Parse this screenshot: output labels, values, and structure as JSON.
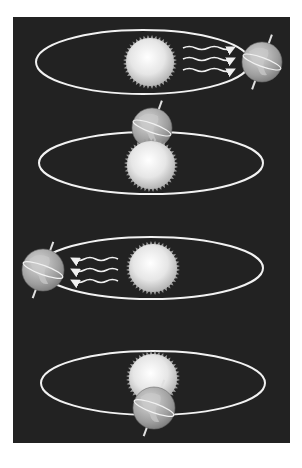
{
  "colors": {
    "page_background": "#ffffff",
    "panel_background": "#222222",
    "orbit_line": "#f2f2f2",
    "sun_center": "#ffffff",
    "sun_edge": "#bdbdbd",
    "earth_ocean": "#9a9a9a",
    "earth_land": "#c8c8c8",
    "wave_color": "#f0f0f0"
  },
  "panels": [
    {
      "id": "position-1",
      "orbit": {
        "cx": 143,
        "cy": 62,
        "rx": 107,
        "ry": 32
      },
      "sun": {
        "cx": 150,
        "cy": 62,
        "r": 24
      },
      "earth": {
        "cx": 262,
        "cy": 62,
        "r": 20,
        "axis_tilt_deg": 20,
        "layer": "front"
      },
      "radiation_waves": {
        "count": 3,
        "direction": "right",
        "x_start": 183,
        "x_end": 233,
        "ys": [
          48,
          59,
          70
        ]
      }
    },
    {
      "id": "position-2",
      "orbit": {
        "cx": 151,
        "cy": 163,
        "rx": 112,
        "ry": 31
      },
      "sun": {
        "cx": 151,
        "cy": 165,
        "r": 24
      },
      "earth": {
        "cx": 152,
        "cy": 128,
        "r": 20,
        "axis_tilt_deg": 20,
        "layer": "behind-sun"
      },
      "radiation_waves": {
        "count": 0
      }
    },
    {
      "id": "position-3",
      "orbit": {
        "cx": 151,
        "cy": 268,
        "rx": 112,
        "ry": 31
      },
      "sun": {
        "cx": 153,
        "cy": 268,
        "r": 24
      },
      "earth": {
        "cx": 43,
        "cy": 270,
        "r": 21,
        "axis_tilt_deg": 20,
        "layer": "front"
      },
      "radiation_waves": {
        "count": 3,
        "direction": "left",
        "x_start": 118,
        "x_end": 73,
        "ys": [
          259,
          270,
          281
        ]
      }
    },
    {
      "id": "position-4",
      "orbit": {
        "cx": 153,
        "cy": 383,
        "rx": 112,
        "ry": 32
      },
      "sun": {
        "cx": 153,
        "cy": 378,
        "r": 24
      },
      "earth": {
        "cx": 154,
        "cy": 408,
        "r": 21,
        "axis_tilt_deg": 20,
        "layer": "in-front-of-sun"
      },
      "radiation_waves": {
        "count": 0
      }
    }
  ]
}
